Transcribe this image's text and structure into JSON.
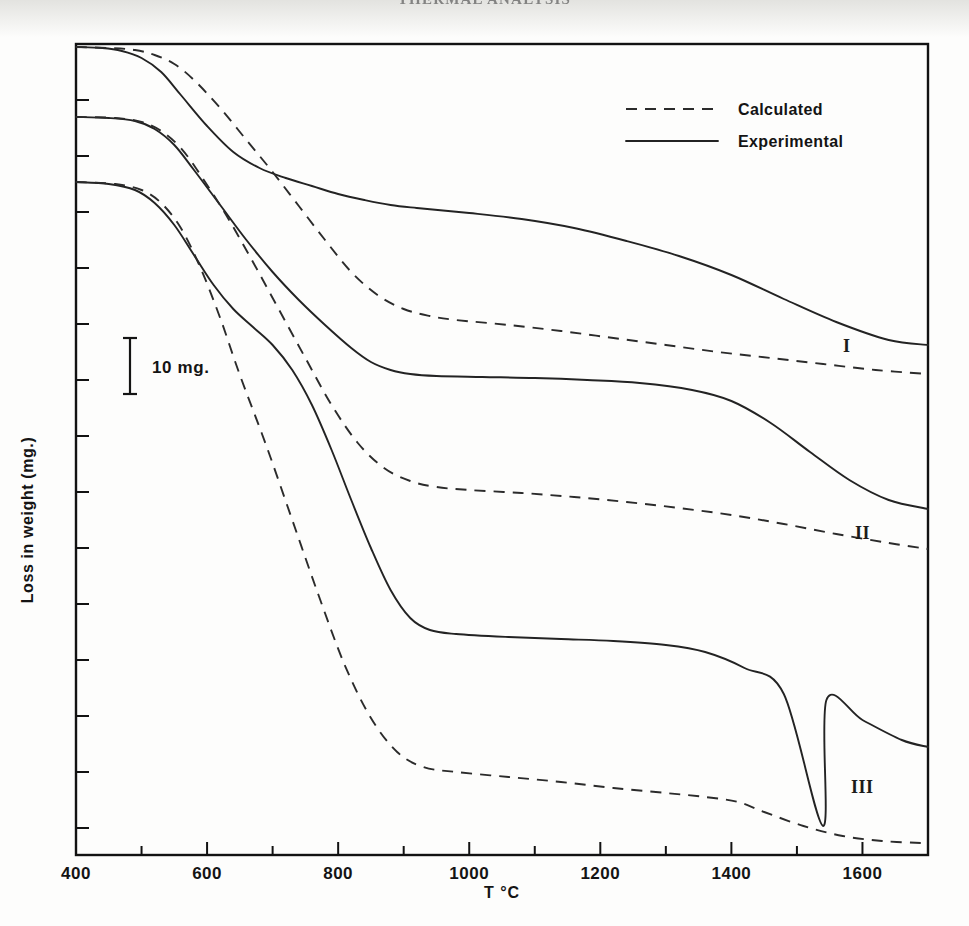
{
  "page": {
    "running_head": "THERMAL ANALYSIS"
  },
  "chart_data": {
    "type": "line",
    "title": "",
    "xlabel": "T °C",
    "ylabel": "Loss in weight  (mg.)",
    "xlim": [
      400,
      1700
    ],
    "ylim_note": "relative mg, offset curves, no numeric y ticks",
    "grid": false,
    "xticks": [
      400,
      600,
      800,
      1000,
      1200,
      1400,
      1600
    ],
    "xtick_labels": [
      "400",
      "600",
      "800",
      "1000",
      "1200",
      "1400",
      "1600"
    ],
    "ytick_labels": [],
    "legend": {
      "position": "upper-right-inside",
      "entries": [
        {
          "label": "Calculated",
          "style": "dashed"
        },
        {
          "label": "Experimental",
          "style": "solid"
        }
      ]
    },
    "scale_bar": {
      "label": "10 mg.",
      "value": 10,
      "unit": "mg",
      "pixels": 56
    },
    "annotations": [
      {
        "text": "I",
        "x": 1668,
        "note": "curve-set-1 label"
      },
      {
        "text": "II",
        "x": 1690,
        "note": "curve-set-2 label"
      },
      {
        "text": "III",
        "x": 1686,
        "note": "curve-set-3 label"
      }
    ],
    "series": [
      {
        "name": "I — Experimental",
        "curve_set": "I",
        "style": "solid",
        "points": [
          [
            400,
            47
          ],
          [
            440,
            48
          ],
          [
            470,
            51
          ],
          [
            500,
            58
          ],
          [
            530,
            72
          ],
          [
            560,
            95
          ],
          [
            600,
            126
          ],
          [
            640,
            152
          ],
          [
            680,
            168
          ],
          [
            720,
            178
          ],
          [
            760,
            186
          ],
          [
            800,
            194
          ],
          [
            840,
            200
          ],
          [
            880,
            205
          ],
          [
            920,
            208
          ],
          [
            1000,
            213
          ],
          [
            1080,
            219
          ],
          [
            1160,
            228
          ],
          [
            1240,
            241
          ],
          [
            1320,
            256
          ],
          [
            1400,
            275
          ],
          [
            1480,
            299
          ],
          [
            1560,
            322
          ],
          [
            1640,
            340
          ],
          [
            1700,
            345
          ]
        ]
      },
      {
        "name": "I — Calculated",
        "curve_set": "I",
        "style": "dashed",
        "points": [
          [
            400,
            47
          ],
          [
            450,
            48
          ],
          [
            490,
            50
          ],
          [
            520,
            55
          ],
          [
            550,
            64
          ],
          [
            580,
            80
          ],
          [
            620,
            108
          ],
          [
            660,
            140
          ],
          [
            700,
            172
          ],
          [
            740,
            206
          ],
          [
            780,
            240
          ],
          [
            820,
            272
          ],
          [
            860,
            295
          ],
          [
            900,
            309
          ],
          [
            940,
            316
          ],
          [
            980,
            320
          ],
          [
            1060,
            325
          ],
          [
            1140,
            331
          ],
          [
            1220,
            338
          ],
          [
            1300,
            345
          ],
          [
            1380,
            352
          ],
          [
            1460,
            358
          ],
          [
            1540,
            364
          ],
          [
            1620,
            370
          ],
          [
            1700,
            374
          ]
        ]
      },
      {
        "name": "II — Experimental",
        "curve_set": "II",
        "style": "solid",
        "points": [
          [
            400,
            117
          ],
          [
            450,
            118
          ],
          [
            490,
            121
          ],
          [
            520,
            129
          ],
          [
            550,
            145
          ],
          [
            580,
            170
          ],
          [
            620,
            205
          ],
          [
            660,
            240
          ],
          [
            700,
            272
          ],
          [
            740,
            300
          ],
          [
            780,
            325
          ],
          [
            820,
            348
          ],
          [
            850,
            362
          ],
          [
            880,
            370
          ],
          [
            910,
            374
          ],
          [
            950,
            376
          ],
          [
            1020,
            377
          ],
          [
            1100,
            378
          ],
          [
            1180,
            380
          ],
          [
            1260,
            383
          ],
          [
            1340,
            390
          ],
          [
            1400,
            401
          ],
          [
            1460,
            423
          ],
          [
            1520,
            452
          ],
          [
            1580,
            480
          ],
          [
            1640,
            500
          ],
          [
            1700,
            509
          ]
        ]
      },
      {
        "name": "II — Calculated",
        "curve_set": "II",
        "style": "dashed",
        "points": [
          [
            400,
            117
          ],
          [
            460,
            118
          ],
          [
            500,
            122
          ],
          [
            530,
            131
          ],
          [
            560,
            148
          ],
          [
            590,
            175
          ],
          [
            630,
            216
          ],
          [
            670,
            262
          ],
          [
            710,
            310
          ],
          [
            750,
            358
          ],
          [
            790,
            405
          ],
          [
            830,
            443
          ],
          [
            870,
            468
          ],
          [
            910,
            481
          ],
          [
            950,
            487
          ],
          [
            1000,
            490
          ],
          [
            1080,
            493
          ],
          [
            1160,
            497
          ],
          [
            1240,
            502
          ],
          [
            1320,
            508
          ],
          [
            1400,
            515
          ],
          [
            1480,
            524
          ],
          [
            1560,
            534
          ],
          [
            1640,
            543
          ],
          [
            1700,
            549
          ]
        ]
      },
      {
        "name": "III — Experimental",
        "curve_set": "III",
        "style": "solid",
        "points": [
          [
            400,
            182
          ],
          [
            450,
            184
          ],
          [
            490,
            190
          ],
          [
            520,
            203
          ],
          [
            550,
            225
          ],
          [
            580,
            255
          ],
          [
            610,
            285
          ],
          [
            640,
            309
          ],
          [
            670,
            327
          ],
          [
            700,
            345
          ],
          [
            730,
            370
          ],
          [
            760,
            405
          ],
          [
            790,
            450
          ],
          [
            820,
            500
          ],
          [
            850,
            548
          ],
          [
            880,
            590
          ],
          [
            910,
            618
          ],
          [
            940,
            630
          ],
          [
            980,
            634
          ],
          [
            1060,
            637
          ],
          [
            1140,
            639
          ],
          [
            1220,
            641
          ],
          [
            1300,
            645
          ],
          [
            1360,
            652
          ],
          [
            1420,
            668
          ],
          [
            1480,
            694
          ],
          [
            1540,
            826
          ],
          [
            1545,
            700
          ],
          [
            1600,
            720
          ],
          [
            1660,
            740
          ],
          [
            1700,
            747
          ]
        ]
      },
      {
        "name": "III — Calculated",
        "curve_set": "III",
        "style": "dashed",
        "points": [
          [
            400,
            182
          ],
          [
            460,
            184
          ],
          [
            500,
            190
          ],
          [
            530,
            203
          ],
          [
            560,
            228
          ],
          [
            590,
            268
          ],
          [
            620,
            318
          ],
          [
            650,
            375
          ],
          [
            690,
            445
          ],
          [
            730,
            520
          ],
          [
            770,
            595
          ],
          [
            810,
            665
          ],
          [
            850,
            718
          ],
          [
            890,
            752
          ],
          [
            930,
            767
          ],
          [
            980,
            772
          ],
          [
            1060,
            777
          ],
          [
            1140,
            782
          ],
          [
            1220,
            788
          ],
          [
            1300,
            793
          ],
          [
            1360,
            797
          ],
          [
            1410,
            802
          ],
          [
            1450,
            812
          ],
          [
            1510,
            826
          ],
          [
            1570,
            836
          ],
          [
            1630,
            841
          ],
          [
            1690,
            843
          ]
        ]
      }
    ]
  }
}
